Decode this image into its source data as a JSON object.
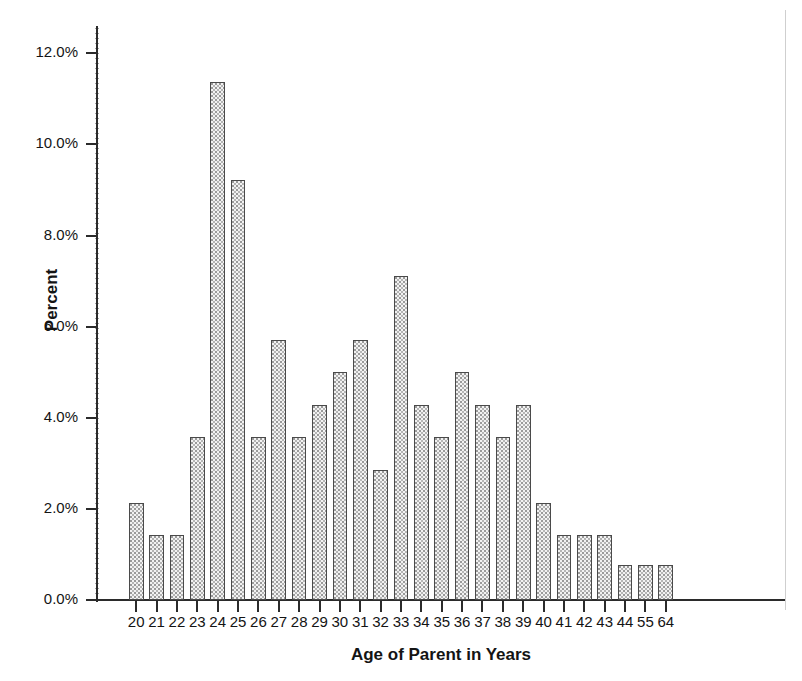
{
  "chart_data": {
    "type": "bar",
    "title": "",
    "xlabel": "Age of Parent in Years",
    "ylabel": "Percent",
    "categories": [
      "20",
      "21",
      "22",
      "23",
      "24",
      "25",
      "26",
      "27",
      "28",
      "29",
      "30",
      "31",
      "32",
      "33",
      "34",
      "35",
      "36",
      "37",
      "38",
      "39",
      "40",
      "41",
      "42",
      "43",
      "44",
      "55",
      "64"
    ],
    "values": [
      2.14,
      1.43,
      1.43,
      3.57,
      11.37,
      9.23,
      3.57,
      5.7,
      3.57,
      4.28,
      5.0,
      5.7,
      2.85,
      7.12,
      4.28,
      3.57,
      5.0,
      4.28,
      3.57,
      4.28,
      2.14,
      1.43,
      1.43,
      1.43,
      0.77,
      0.77,
      0.77
    ],
    "ylim": [
      0,
      12.6
    ],
    "xlim_note": "categorical",
    "ytick_values": [
      0.0,
      2.0,
      4.0,
      6.0,
      8.0,
      10.0,
      12.0
    ],
    "ytick_labels": [
      "0.0%",
      "2.0%",
      "4.0%",
      "6.0%",
      "8.0%",
      "10.0%",
      "12.0%"
    ],
    "grid": false,
    "legend": false,
    "legend_position": "none",
    "bar_fill_color": "#f2f2f2",
    "bar_edge_color": "#4a4a4a",
    "axis_color": "#2b2b2b"
  }
}
